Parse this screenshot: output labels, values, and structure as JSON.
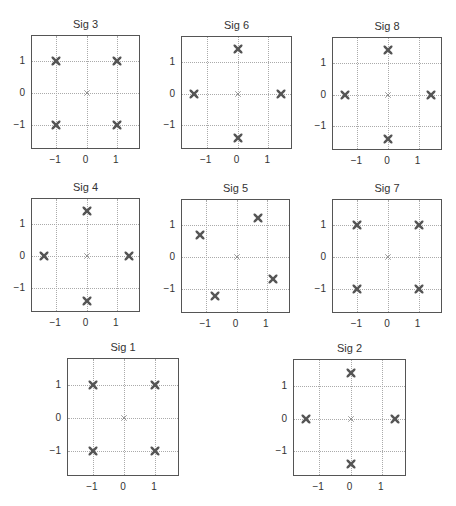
{
  "chart_data": [
    {
      "type": "scatter",
      "title": "Sig 3",
      "xlim": [
        -1.8,
        1.8
      ],
      "ylim": [
        -1.8,
        1.8
      ],
      "xticks": [
        -1,
        0,
        1
      ],
      "yticks": [
        -1,
        0,
        1
      ],
      "xtick_labels": [
        "−1",
        "0",
        "1"
      ],
      "ytick_labels": [
        "1",
        "0",
        "−1"
      ],
      "grid": true,
      "points": [
        [
          -1,
          1
        ],
        [
          1,
          1
        ],
        [
          -1,
          -1
        ],
        [
          1,
          -1
        ]
      ],
      "origin_marker": [
        0,
        0
      ],
      "box": {
        "left": 31,
        "top": 35,
        "width": 109,
        "height": 114
      }
    },
    {
      "type": "scatter",
      "title": "Sig 6",
      "xlim": [
        -1.8,
        1.8
      ],
      "ylim": [
        -1.8,
        1.8
      ],
      "xticks": [
        -1,
        0,
        1
      ],
      "yticks": [
        -1,
        0,
        1
      ],
      "xtick_labels": [
        "−1",
        "0",
        "1"
      ],
      "ytick_labels": [
        "1",
        "0",
        "−1"
      ],
      "grid": true,
      "points": [
        [
          0,
          1.414
        ],
        [
          -1.414,
          0
        ],
        [
          1.414,
          0
        ],
        [
          0,
          -1.414
        ]
      ],
      "origin_marker": [
        0,
        0
      ],
      "box": {
        "left": 181,
        "top": 36,
        "width": 111,
        "height": 113
      }
    },
    {
      "type": "scatter",
      "title": "Sig 8",
      "xlim": [
        -1.8,
        1.8
      ],
      "ylim": [
        -1.8,
        1.8
      ],
      "xticks": [
        -1,
        0,
        1
      ],
      "yticks": [
        -1,
        0,
        1
      ],
      "xtick_labels": [
        "−1",
        "0",
        "1"
      ],
      "ytick_labels": [
        "1",
        "0",
        "−1"
      ],
      "grid": true,
      "points": [
        [
          0,
          1.414
        ],
        [
          -1.414,
          0
        ],
        [
          1.414,
          0
        ],
        [
          0,
          -1.414
        ]
      ],
      "origin_marker": [
        0,
        0
      ],
      "box": {
        "left": 332,
        "top": 37,
        "width": 110,
        "height": 113
      }
    },
    {
      "type": "scatter",
      "title": "Sig 4",
      "xlim": [
        -1.8,
        1.8
      ],
      "ylim": [
        -1.8,
        1.8
      ],
      "xticks": [
        -1,
        0,
        1
      ],
      "yticks": [
        -1,
        0,
        1
      ],
      "xtick_labels": [
        "−1",
        "0",
        "1"
      ],
      "ytick_labels": [
        "1",
        "0",
        "−1"
      ],
      "grid": true,
      "points": [
        [
          0,
          1.414
        ],
        [
          -1.414,
          0
        ],
        [
          1.414,
          0
        ],
        [
          0,
          -1.414
        ]
      ],
      "origin_marker": [
        0,
        0
      ],
      "box": {
        "left": 31,
        "top": 198,
        "width": 109,
        "height": 114
      }
    },
    {
      "type": "scatter",
      "title": "Sig 5",
      "xlim": [
        -1.8,
        1.8
      ],
      "ylim": [
        -1.8,
        1.8
      ],
      "xticks": [
        -1,
        0,
        1
      ],
      "yticks": [
        -1,
        0,
        1
      ],
      "xtick_labels": [
        "−1",
        "0",
        "1"
      ],
      "ytick_labels": [
        "1",
        "0",
        "−1"
      ],
      "grid": true,
      "points": [
        [
          0.71,
          1.22
        ],
        [
          -1.22,
          0.71
        ],
        [
          1.22,
          -0.71
        ],
        [
          -0.71,
          -1.22
        ]
      ],
      "origin_marker": [
        0,
        0
      ],
      "box": {
        "left": 181,
        "top": 199,
        "width": 109,
        "height": 114
      }
    },
    {
      "type": "scatter",
      "title": "Sig 7",
      "xlim": [
        -1.8,
        1.8
      ],
      "ylim": [
        -1.8,
        1.8
      ],
      "xticks": [
        -1,
        0,
        1
      ],
      "yticks": [
        -1,
        0,
        1
      ],
      "xtick_labels": [
        "−1",
        "0",
        "1"
      ],
      "ytick_labels": [
        "1",
        "0",
        "−1"
      ],
      "grid": true,
      "points": [
        [
          -1,
          1
        ],
        [
          1,
          1
        ],
        [
          -1,
          -1
        ],
        [
          1,
          -1
        ]
      ],
      "origin_marker": [
        0,
        0
      ],
      "box": {
        "left": 332,
        "top": 199,
        "width": 110,
        "height": 114
      }
    },
    {
      "type": "scatter",
      "title": "Sig 1",
      "xlim": [
        -1.8,
        1.8
      ],
      "ylim": [
        -1.8,
        1.8
      ],
      "xticks": [
        -1,
        0,
        1
      ],
      "yticks": [
        -1,
        0,
        1
      ],
      "xtick_labels": [
        "−1",
        "0",
        "1"
      ],
      "ytick_labels": [
        "1",
        "0",
        "−1"
      ],
      "grid": true,
      "points": [
        [
          -1,
          1
        ],
        [
          1,
          1
        ],
        [
          -1,
          -1
        ],
        [
          1,
          -1
        ]
      ],
      "origin_marker": [
        0,
        0
      ],
      "box": {
        "left": 67,
        "top": 358,
        "width": 112,
        "height": 118
      }
    },
    {
      "type": "scatter",
      "title": "Sig 2",
      "xlim": [
        -1.8,
        1.8
      ],
      "ylim": [
        -1.8,
        1.8
      ],
      "xticks": [
        -1,
        0,
        1
      ],
      "yticks": [
        -1,
        0,
        1
      ],
      "xtick_labels": [
        "−1",
        "0",
        "1"
      ],
      "ytick_labels": [
        "1",
        "0",
        "−1"
      ],
      "grid": true,
      "points": [
        [
          0,
          1.414
        ],
        [
          -1.414,
          0
        ],
        [
          1.414,
          0
        ],
        [
          0,
          -1.414
        ]
      ],
      "origin_marker": [
        0,
        0
      ],
      "box": {
        "left": 293,
        "top": 359,
        "width": 113,
        "height": 117
      }
    }
  ],
  "colors": {
    "marker": "#555555",
    "origin_marker": "#777777",
    "grid": "#aaaaaa",
    "axes": "#555555"
  }
}
